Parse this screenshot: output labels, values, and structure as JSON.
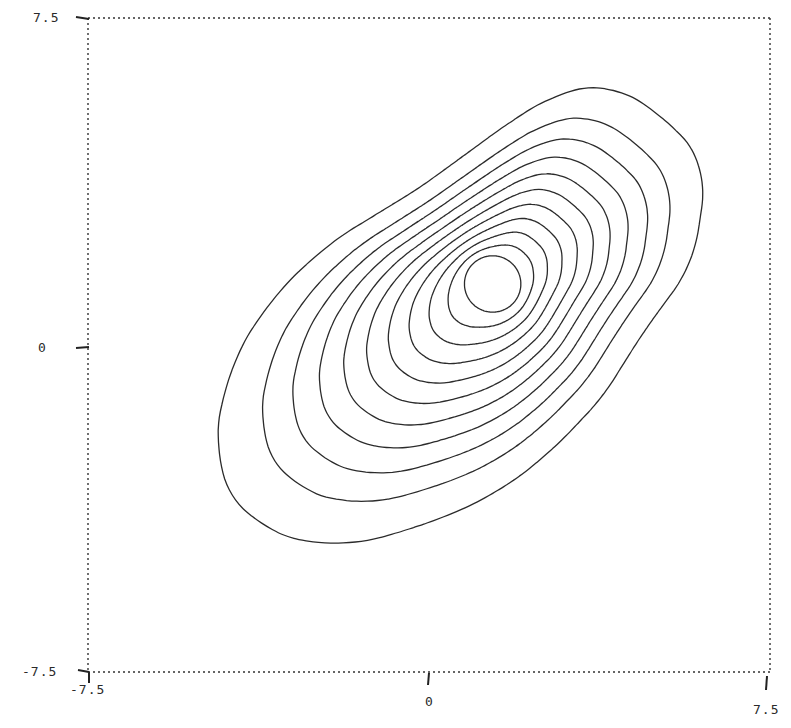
{
  "chart_data": {
    "type": "contour",
    "title": "",
    "xlabel": "",
    "ylabel": "",
    "xlim": [
      -7.5,
      7.5
    ],
    "ylim": [
      -7.5,
      7.5
    ],
    "grid": false,
    "legend": null,
    "frame_style": "dotted",
    "x_ticks": [
      {
        "value": -7.5,
        "label": "-7.5"
      },
      {
        "value": 0,
        "label": "0"
      },
      {
        "value": 7.5,
        "label": "7.5"
      }
    ],
    "y_ticks": [
      {
        "value": 7.5,
        "label": "7.5"
      },
      {
        "value": 0,
        "label": "0"
      },
      {
        "value": -7.5,
        "label": "-7.5"
      }
    ],
    "contour_levels": 11,
    "peak": {
      "x": 1.4,
      "y": 1.4
    },
    "outer_contour_points": [
      [
        4.0,
        6.0
      ],
      [
        5.3,
        5.1
      ],
      [
        6.1,
        4.1
      ],
      [
        5.8,
        1.9
      ],
      [
        4.7,
        0.3
      ],
      [
        3.8,
        -1.2
      ],
      [
        2.7,
        -2.4
      ],
      [
        1.6,
        -3.3
      ],
      [
        0.2,
        -4.0
      ],
      [
        -2.2,
        -4.7
      ],
      [
        -4.1,
        -4.0
      ],
      [
        -4.7,
        -2.9
      ],
      [
        -4.5,
        -0.8
      ],
      [
        -3.5,
        1.0
      ],
      [
        -2.2,
        2.3
      ],
      [
        -0.2,
        3.6
      ],
      [
        1.8,
        5.1
      ],
      [
        2.9,
        5.8
      ]
    ],
    "inner_contour": {
      "center": [
        1.4,
        1.4
      ],
      "rx": 0.62,
      "ry": 0.62
    }
  },
  "axes": {
    "x_tick_labels": [
      "-7.5",
      "0",
      "7.5"
    ],
    "y_tick_labels": [
      "7.5",
      "0",
      "-7.5"
    ]
  }
}
